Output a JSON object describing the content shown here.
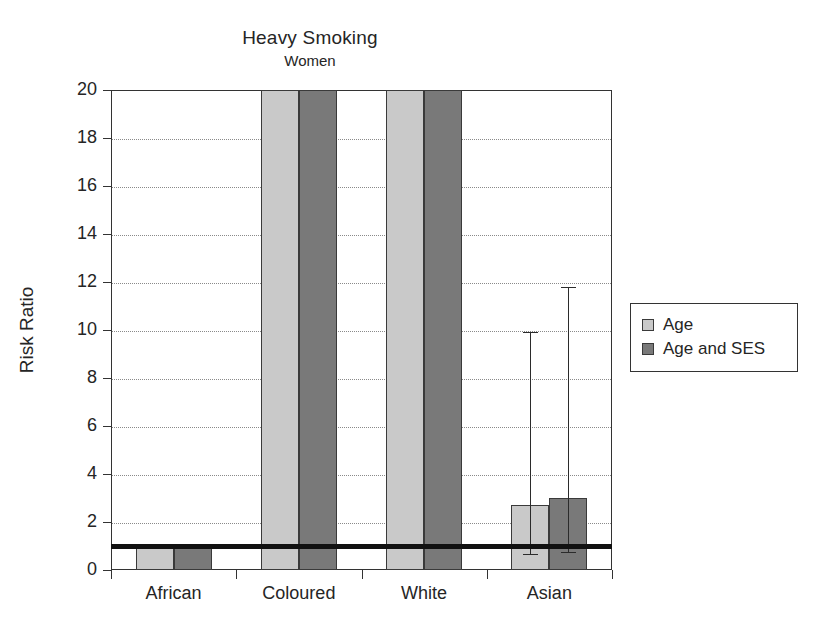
{
  "chart_data": {
    "type": "bar",
    "title": "Heavy Smoking",
    "subtitle": "Women",
    "xlabel": "",
    "ylabel": "Risk Ratio",
    "ylim": [
      0,
      20
    ],
    "yticks": [
      0,
      2,
      4,
      6,
      8,
      10,
      12,
      14,
      16,
      18,
      20
    ],
    "grid": true,
    "legend_position": "right",
    "reference_line": 1.0,
    "categories": [
      "African",
      "Coloured",
      "White",
      "Asian"
    ],
    "series": [
      {
        "name": "Age",
        "color": "#c9c9c9",
        "values": [
          1.0,
          20.0,
          20.0,
          2.7
        ],
        "clipped": [
          false,
          true,
          true,
          false
        ],
        "ci_low": [
          null,
          null,
          null,
          0.65
        ],
        "ci_high": [
          null,
          null,
          null,
          9.9
        ]
      },
      {
        "name": "Age and SES",
        "color": "#797979",
        "values": [
          1.0,
          20.0,
          20.0,
          3.0
        ],
        "clipped": [
          false,
          true,
          true,
          false
        ],
        "ci_low": [
          null,
          null,
          null,
          0.75
        ],
        "ci_high": [
          null,
          null,
          null,
          11.8
        ]
      }
    ]
  },
  "axis": {
    "y_tick_labels": [
      "0",
      "2",
      "4",
      "6",
      "8",
      "10",
      "12",
      "14",
      "16",
      "18",
      "20"
    ],
    "x_tick_labels": [
      "African",
      "Coloured",
      "White",
      "Asian"
    ]
  },
  "legend": {
    "items": [
      {
        "label": "Age",
        "swatch_class": "series-age"
      },
      {
        "label": "Age and SES",
        "swatch_class": "series-age-ses"
      }
    ]
  },
  "colors": {
    "series_age": "#c9c9c9",
    "series_age_ses": "#797979",
    "axis": "#333333",
    "grid": "#8a8a8a",
    "reference_line": "#111111"
  }
}
